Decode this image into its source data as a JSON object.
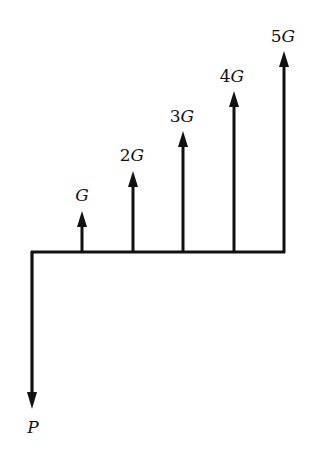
{
  "diagram": {
    "type": "cash-flow-diagram",
    "colors": {
      "line": "#111111",
      "background": "#ffffff"
    },
    "timeline": {
      "x_start": 31,
      "x_end": 285,
      "y": 252
    },
    "present": {
      "label": "P",
      "x": 32,
      "from_y": 252,
      "tip_y": 408,
      "direction": "down"
    },
    "flows": [
      {
        "label_coef": "",
        "label_var": "G",
        "period": 1,
        "x": 82,
        "tip_y": 212,
        "label_y": 201
      },
      {
        "label_coef": "2",
        "label_var": "G",
        "period": 2,
        "x": 133,
        "tip_y": 172,
        "label_y": 161
      },
      {
        "label_coef": "3",
        "label_var": "G",
        "period": 3,
        "x": 183,
        "tip_y": 132,
        "label_y": 122
      },
      {
        "label_coef": "4",
        "label_var": "G",
        "period": 4,
        "x": 234,
        "tip_y": 92,
        "label_y": 82
      },
      {
        "label_coef": "5",
        "label_var": "G",
        "period": 5,
        "x": 284,
        "tip_y": 52,
        "label_y": 42
      }
    ]
  }
}
